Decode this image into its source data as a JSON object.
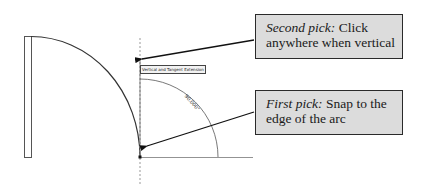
{
  "diagram": {
    "tooltip": "Vertical and Tangent Extension",
    "arc_dimension_label": "90.000°",
    "colors": {
      "line": "#3a3a3a",
      "dashed_guide": "#9a9a9a",
      "callout_fill": "#dcdcdc",
      "callout_border": "#2a2a2a"
    }
  },
  "callouts": [
    {
      "lead": "Second pick:",
      "text": " Click anywhere when vertical"
    },
    {
      "lead": "First pick:",
      "text": " Snap to the edge of the arc"
    }
  ]
}
